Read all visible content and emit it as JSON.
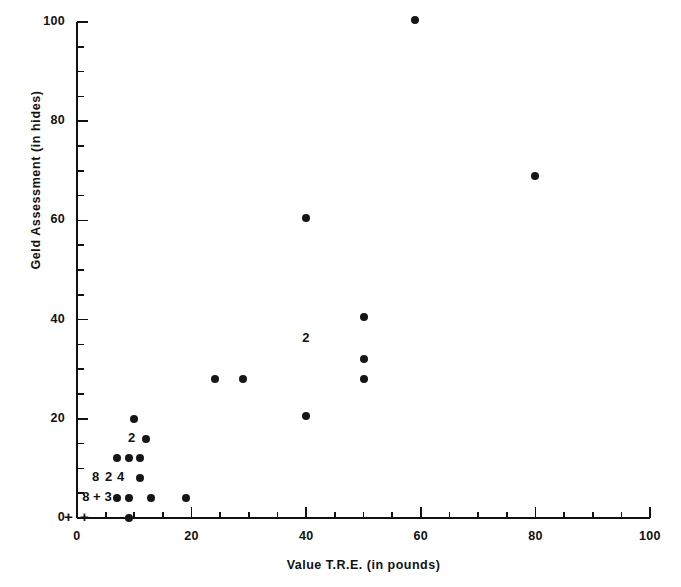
{
  "chart_data": {
    "type": "scatter",
    "title": "",
    "xlabel": "Value T.R.E. (in pounds)",
    "ylabel": "Geld Assessment (in hides)",
    "xlim": [
      0,
      100
    ],
    "ylim": [
      0,
      100
    ],
    "xticks": [
      0,
      20,
      40,
      60,
      80,
      100
    ],
    "yticks": [
      0,
      20,
      40,
      60,
      80,
      100
    ],
    "x_minor_tick_step": 5,
    "y_minor_tick_step": 5,
    "grid": false,
    "legend": null,
    "marker": "filled-circle",
    "marker_color": "#15161a",
    "axis_color": "#111111",
    "background": "#ffffff",
    "points": [
      {
        "x": 59,
        "y": 100.5
      },
      {
        "x": 80,
        "y": 69
      },
      {
        "x": 40,
        "y": 60.5
      },
      {
        "x": 50,
        "y": 40.5
      },
      {
        "x": 50,
        "y": 32
      },
      {
        "x": 50,
        "y": 28
      },
      {
        "x": 24,
        "y": 28
      },
      {
        "x": 29,
        "y": 28
      },
      {
        "x": 40,
        "y": 20.5
      },
      {
        "x": 10,
        "y": 20
      },
      {
        "x": 12,
        "y": 16
      },
      {
        "x": 7,
        "y": 12
      },
      {
        "x": 9,
        "y": 12
      },
      {
        "x": 11,
        "y": 12
      },
      {
        "x": 11,
        "y": 8
      },
      {
        "x": 7,
        "y": 4
      },
      {
        "x": 9,
        "y": 4
      },
      {
        "x": 13,
        "y": 4
      },
      {
        "x": 19,
        "y": 4
      },
      {
        "x": 9,
        "y": 0
      }
    ],
    "count_annotations": [
      {
        "text": "2",
        "x": 40,
        "y": 36,
        "note": "overlapping-pair-marker"
      },
      {
        "text": "2",
        "x": 9.6,
        "y": 16,
        "note": "overlapping-pair-marker"
      },
      {
        "text": "8",
        "x": 3.3,
        "y": 8,
        "note": "eight-coincident-points"
      },
      {
        "text": "2",
        "x": 5.6,
        "y": 8,
        "note": "two-coincident-points"
      },
      {
        "text": "4",
        "x": 7.7,
        "y": 8,
        "note": "four-coincident-points"
      },
      {
        "text": "8",
        "x": 1.6,
        "y": 4,
        "note": "eight-coincident-points"
      },
      {
        "text": "+",
        "x": 3.5,
        "y": 4,
        "note": "plus-separator"
      },
      {
        "text": "3",
        "x": 5.5,
        "y": 4,
        "note": "three-coincident-points"
      }
    ],
    "baseline_plus_marks": [
      {
        "text": "+",
        "x": 1.2,
        "y": 0
      },
      {
        "text": "+",
        "x": 4.0,
        "y": 0
      }
    ]
  },
  "axes": {
    "y_tick_labels": [
      "0",
      "20",
      "40",
      "60",
      "80",
      "100"
    ],
    "x_tick_labels": [
      "0",
      "20",
      "40",
      "60",
      "80",
      "100"
    ]
  }
}
